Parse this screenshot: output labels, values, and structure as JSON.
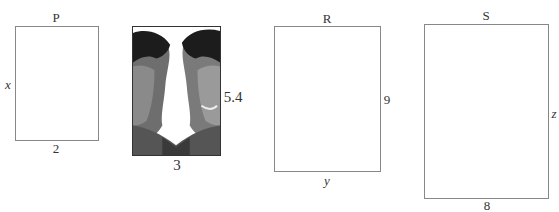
{
  "figure": {
    "rectangles": [
      {
        "id": "P",
        "title": "P",
        "width_label": "2",
        "height_label": "x"
      },
      {
        "id": "photo",
        "title": "",
        "width_label": "3",
        "height_label": "5.4",
        "content": "photo of two faces (mirrored)"
      },
      {
        "id": "R",
        "title": "R",
        "width_label": "y",
        "height_label": "9"
      },
      {
        "id": "S",
        "title": "S",
        "width_label": "8",
        "height_label": "z"
      }
    ],
    "colors": {
      "outline": "#888888",
      "photo_border": "#333333",
      "text": "#333333"
    }
  }
}
